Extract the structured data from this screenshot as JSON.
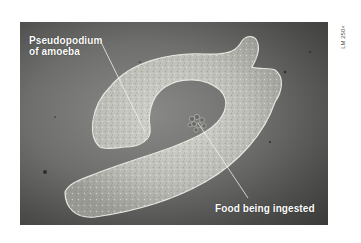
{
  "figure": {
    "magnification": "LM 250×",
    "labels": [
      {
        "id": "pseudopodium",
        "line1": "Pseudopodium",
        "line2": "of amoeba"
      },
      {
        "id": "food",
        "text": "Food being ingested"
      }
    ],
    "colors": {
      "background": "#ffffff",
      "photo_bg": "#6e6e6c",
      "cell_body": "#c9c9c4",
      "label_text": "#ffffff",
      "pointer_line": "#f0f0f0"
    }
  }
}
